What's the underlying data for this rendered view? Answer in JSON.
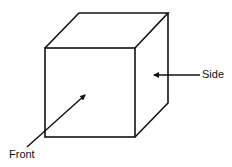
{
  "diagram": {
    "labels": {
      "side": "Side",
      "front": "Front"
    },
    "colors": {
      "stroke": "#111111",
      "background": "#ffffff"
    }
  }
}
